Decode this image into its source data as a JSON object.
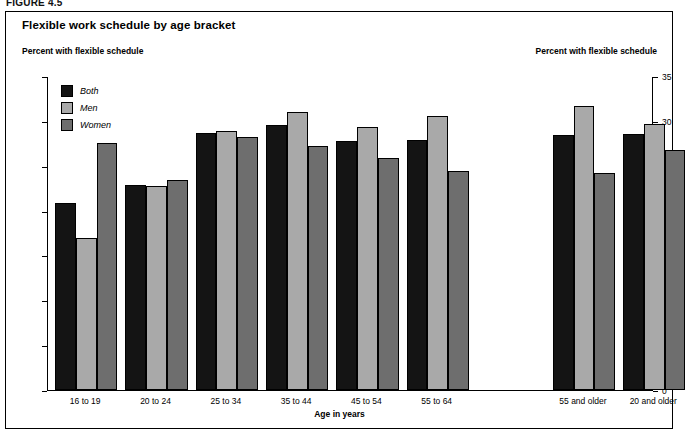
{
  "figure_label": "FIGURE 4.5",
  "header": {
    "title": "Flexible work schedule by age bracket",
    "left_axis_caption": "Percent with flexible schedule",
    "right_axis_caption": "Percent with flexible schedule"
  },
  "legend": {
    "items": [
      {
        "label": "Both",
        "color": "#141414"
      },
      {
        "label": "Men",
        "color": "#a9a9a9"
      },
      {
        "label": "Women",
        "color": "#6e6e6e"
      }
    ]
  },
  "chart_data": {
    "type": "bar",
    "title": "Flexible work schedule by age bracket",
    "xlabel": "Age in years",
    "ylabel": "Percent with flexible schedule",
    "ylim": [
      0,
      35
    ],
    "yticks": [
      0,
      5,
      10,
      15,
      20,
      25,
      30,
      35
    ],
    "ytick_labels": [
      "0",
      "5",
      "10",
      "15",
      "20",
      "25",
      "30",
      "35"
    ],
    "grid": false,
    "legend_position": "upper-left-inside",
    "dual_axis": true,
    "categories": [
      "16 to 19",
      "20 to 24",
      "25 to 34",
      "35 to 44",
      "45 to 54",
      "55 to 64",
      "55 and older",
      "20 and older"
    ],
    "series": [
      {
        "name": "Both",
        "color": "#141414",
        "values": [
          20.8,
          22.9,
          28.6,
          29.5,
          27.8,
          27.9,
          28.4,
          28.5
        ]
      },
      {
        "name": "Men",
        "color": "#a9a9a9",
        "values": [
          16.9,
          22.7,
          28.9,
          31.0,
          29.3,
          30.5,
          31.7,
          29.7
        ]
      },
      {
        "name": "Women",
        "color": "#6e6e6e",
        "values": [
          27.5,
          23.4,
          28.2,
          27.2,
          25.9,
          24.4,
          24.2,
          26.8
        ]
      }
    ]
  }
}
